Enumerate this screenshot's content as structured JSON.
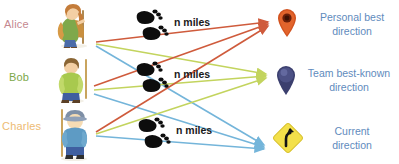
{
  "canvas": {
    "width": 399,
    "height": 164,
    "background": "#ffffff"
  },
  "people": [
    {
      "name": "Alice",
      "label_color": "#c4878f",
      "icon": "hiker-with-backpack-icon"
    },
    {
      "name": "Bob",
      "label_color": "#7da84a",
      "icon": "hiker-with-staff-icon"
    },
    {
      "name": "Charles",
      "label_color": "#edbb73",
      "icon": "hiker-with-hat-icon"
    }
  ],
  "distances": [
    {
      "text": "n miles",
      "icon": "footprints-icon"
    },
    {
      "text": "n miles",
      "icon": "footprints-icon"
    },
    {
      "text": "n miles",
      "icon": "footprints-icon"
    }
  ],
  "targets": [
    {
      "line1": "Personal best",
      "line2": "direction",
      "icon": "map-pin-icon",
      "icon_color": "#d2521f",
      "arrow_color": "#cf5b3c",
      "text_color": "#5f8bbd"
    },
    {
      "line1": "Team best-known",
      "line2": "direction",
      "icon": "location-balloon-icon",
      "icon_color": "#3b3f6e",
      "arrow_color": "#c3d45e",
      "text_color": "#5f8bbd"
    },
    {
      "line1": "Current",
      "line2": "direction",
      "icon": "curve-road-sign-icon",
      "icon_color": "#f3e04a",
      "arrow_color": "#74b5da",
      "text_color": "#5f8bbd"
    }
  ],
  "arrows": [
    {
      "from": "Alice",
      "to": "Personal best",
      "color": "#cf5b3c"
    },
    {
      "from": "Alice",
      "to": "Team best-known",
      "color": "#c3d45e"
    },
    {
      "from": "Alice",
      "to": "Current",
      "color": "#74b5da"
    },
    {
      "from": "Bob",
      "to": "Personal best",
      "color": "#cf5b3c"
    },
    {
      "from": "Bob",
      "to": "Team best-known",
      "color": "#c3d45e"
    },
    {
      "from": "Bob",
      "to": "Current",
      "color": "#74b5da"
    },
    {
      "from": "Charles",
      "to": "Personal best",
      "color": "#cf5b3c"
    },
    {
      "from": "Charles",
      "to": "Team best-known",
      "color": "#c3d45e"
    },
    {
      "from": "Charles",
      "to": "Current",
      "color": "#74b5da"
    }
  ]
}
